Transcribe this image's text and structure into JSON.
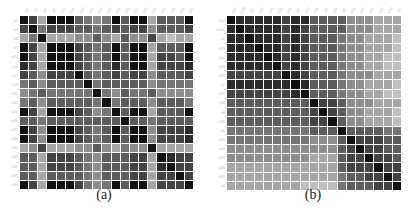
{
  "chart_data": [
    {
      "type": "heatmap",
      "title": "",
      "caption": "(a)",
      "xlabel": "",
      "ylabel": "",
      "colorscale": "grayscale (black = highest similarity, white = lowest)",
      "value_range": [
        0,
        9
      ],
      "value_note": "darkness levels read from pixels: 0 = black, 9 = white",
      "row_labels": [
        "s2",
        "s3",
        "s6",
        "s7",
        "s13",
        "s14",
        "s17",
        "s18",
        "s19",
        "s20",
        "s21",
        "s28",
        "s27",
        "s30",
        "s31",
        "s34",
        "s35",
        "s38",
        "s40"
      ],
      "col_labels": [
        "s2",
        "s3",
        "s6",
        "s7",
        "s13",
        "s14",
        "s17",
        "s18",
        "s19",
        "s20",
        "s21",
        "s28",
        "s27",
        "s30",
        "s31",
        "s34",
        "s35",
        "s38",
        "s40"
      ],
      "matrix": [
        [
          0,
          2,
          6,
          0,
          0,
          0,
          3,
          4,
          5,
          4,
          0,
          3,
          0,
          0,
          6,
          3,
          3,
          3,
          0
        ],
        [
          2,
          0,
          4,
          2,
          2,
          2,
          3,
          3,
          4,
          3,
          2,
          3,
          2,
          2,
          5,
          3,
          3,
          3,
          2
        ],
        [
          6,
          4,
          0,
          6,
          6,
          6,
          5,
          5,
          3,
          5,
          6,
          3,
          5,
          5,
          2,
          6,
          7,
          6,
          6
        ],
        [
          0,
          2,
          6,
          0,
          0,
          0,
          2,
          3,
          4,
          3,
          0,
          3,
          0,
          0,
          6,
          3,
          3,
          3,
          0
        ],
        [
          0,
          2,
          6,
          0,
          0,
          0,
          2,
          3,
          4,
          3,
          0,
          3,
          0,
          0,
          6,
          2,
          2,
          3,
          0
        ],
        [
          1,
          2,
          6,
          0,
          0,
          0,
          2,
          3,
          4,
          3,
          1,
          3,
          0,
          0,
          6,
          2,
          2,
          2,
          1
        ],
        [
          2,
          3,
          5,
          2,
          2,
          2,
          0,
          3,
          4,
          3,
          2,
          3,
          2,
          2,
          5,
          3,
          3,
          3,
          2
        ],
        [
          4,
          3,
          5,
          3,
          3,
          3,
          3,
          0,
          4,
          3,
          3,
          3,
          3,
          3,
          5,
          4,
          4,
          4,
          4
        ],
        [
          5,
          4,
          3,
          4,
          4,
          4,
          4,
          4,
          0,
          4,
          5,
          3,
          4,
          4,
          3,
          5,
          5,
          5,
          5
        ],
        [
          4,
          3,
          5,
          3,
          3,
          3,
          3,
          3,
          4,
          0,
          4,
          3,
          3,
          3,
          5,
          3,
          3,
          3,
          4
        ],
        [
          0,
          2,
          6,
          0,
          0,
          0,
          2,
          3,
          5,
          4,
          0,
          3,
          0,
          0,
          6,
          3,
          3,
          3,
          0
        ],
        [
          3,
          3,
          4,
          3,
          3,
          3,
          3,
          3,
          3,
          3,
          3,
          0,
          3,
          3,
          4,
          3,
          3,
          3,
          3
        ],
        [
          0,
          2,
          5,
          0,
          0,
          0,
          2,
          3,
          4,
          3,
          0,
          3,
          0,
          0,
          5,
          2,
          2,
          2,
          1
        ],
        [
          0,
          2,
          5,
          0,
          0,
          0,
          2,
          3,
          4,
          3,
          0,
          3,
          0,
          0,
          5,
          2,
          2,
          2,
          1
        ],
        [
          6,
          5,
          2,
          6,
          6,
          6,
          5,
          5,
          3,
          5,
          6,
          4,
          5,
          5,
          0,
          6,
          6,
          6,
          6
        ],
        [
          3,
          3,
          6,
          2,
          2,
          2,
          3,
          4,
          5,
          3,
          3,
          3,
          2,
          2,
          6,
          0,
          1,
          2,
          2
        ],
        [
          3,
          3,
          6,
          2,
          2,
          2,
          3,
          4,
          5,
          3,
          3,
          3,
          2,
          2,
          6,
          1,
          0,
          2,
          2
        ],
        [
          3,
          3,
          6,
          3,
          3,
          3,
          3,
          4,
          5,
          3,
          3,
          3,
          2,
          2,
          6,
          2,
          2,
          0,
          2
        ],
        [
          0,
          2,
          6,
          0,
          0,
          0,
          2,
          4,
          5,
          4,
          0,
          3,
          0,
          0,
          6,
          2,
          2,
          2,
          0
        ]
      ]
    },
    {
      "type": "heatmap",
      "title": "",
      "caption": "(b)",
      "xlabel": "",
      "ylabel": "",
      "colorscale": "grayscale (black = highest similarity, white = lowest)",
      "value_range": [
        0,
        9
      ],
      "value_note": "darkness levels read from pixels: 0 = black, 9 = white; reordered/clustered matrix",
      "row_labels": [
        "s10",
        "s100",
        "s2",
        "s19",
        "s44",
        "s35",
        "s16",
        "s7",
        "s27",
        "s36",
        "s8",
        "s38",
        "s6",
        "s13",
        "s40",
        "s23",
        "s29",
        "s30",
        "s4"
      ],
      "col_labels": [
        "s10",
        "s100",
        "s2",
        "s19",
        "s44",
        "s35",
        "s16",
        "s7",
        "s27",
        "s36",
        "s8",
        "s38",
        "s6",
        "s13",
        "s40",
        "s23",
        "s29",
        "s30",
        "s4"
      ],
      "matrix": [
        [
          0,
          1,
          1,
          1,
          1,
          1,
          2,
          1,
          1,
          3,
          3,
          3,
          3,
          5,
          5,
          5,
          6,
          6,
          6
        ],
        [
          1,
          0,
          1,
          1,
          1,
          1,
          2,
          1,
          2,
          3,
          3,
          3,
          3,
          5,
          5,
          5,
          6,
          6,
          6
        ],
        [
          1,
          1,
          0,
          1,
          1,
          1,
          2,
          1,
          2,
          3,
          3,
          3,
          4,
          5,
          5,
          6,
          6,
          6,
          7
        ],
        [
          1,
          1,
          1,
          0,
          1,
          1,
          2,
          1,
          2,
          3,
          3,
          3,
          4,
          5,
          5,
          6,
          6,
          6,
          7
        ],
        [
          1,
          1,
          1,
          1,
          0,
          1,
          2,
          1,
          2,
          3,
          3,
          3,
          4,
          5,
          5,
          6,
          6,
          7,
          7
        ],
        [
          1,
          1,
          1,
          1,
          1,
          0,
          2,
          1,
          2,
          3,
          3,
          3,
          4,
          5,
          5,
          6,
          6,
          7,
          7
        ],
        [
          2,
          2,
          2,
          2,
          2,
          2,
          0,
          1,
          2,
          3,
          3,
          3,
          4,
          5,
          5,
          5,
          6,
          6,
          6
        ],
        [
          1,
          1,
          1,
          1,
          1,
          1,
          1,
          0,
          1,
          3,
          3,
          3,
          4,
          5,
          5,
          6,
          6,
          6,
          7
        ],
        [
          2,
          2,
          2,
          2,
          2,
          2,
          2,
          1,
          0,
          3,
          3,
          3,
          4,
          5,
          5,
          6,
          6,
          7,
          7
        ],
        [
          3,
          3,
          3,
          3,
          3,
          3,
          3,
          3,
          3,
          0,
          2,
          2,
          3,
          5,
          5,
          5,
          6,
          6,
          6
        ],
        [
          3,
          3,
          3,
          3,
          3,
          3,
          3,
          3,
          3,
          2,
          0,
          2,
          3,
          5,
          5,
          6,
          6,
          6,
          7
        ],
        [
          3,
          3,
          3,
          3,
          3,
          3,
          3,
          3,
          3,
          2,
          2,
          0,
          3,
          5,
          5,
          6,
          6,
          6,
          7
        ],
        [
          4,
          4,
          4,
          4,
          4,
          4,
          4,
          4,
          4,
          3,
          3,
          3,
          0,
          3,
          3,
          3,
          3,
          4,
          4
        ],
        [
          4,
          4,
          4,
          4,
          4,
          4,
          4,
          4,
          4,
          5,
          5,
          5,
          3,
          0,
          2,
          2,
          2,
          3,
          3
        ],
        [
          5,
          5,
          5,
          5,
          5,
          5,
          5,
          5,
          5,
          5,
          5,
          5,
          3,
          2,
          0,
          2,
          2,
          3,
          3
        ],
        [
          5,
          5,
          5,
          5,
          5,
          5,
          5,
          5,
          5,
          6,
          6,
          6,
          3,
          2,
          2,
          0,
          2,
          2,
          3
        ],
        [
          6,
          6,
          6,
          6,
          6,
          6,
          6,
          6,
          6,
          6,
          6,
          6,
          3,
          2,
          2,
          2,
          0,
          2,
          2
        ],
        [
          6,
          6,
          6,
          6,
          6,
          6,
          6,
          6,
          6,
          6,
          6,
          6,
          4,
          3,
          3,
          2,
          2,
          0,
          2
        ],
        [
          6,
          6,
          6,
          6,
          6,
          6,
          6,
          6,
          7,
          7,
          7,
          7,
          4,
          3,
          3,
          3,
          2,
          2,
          0
        ]
      ]
    }
  ],
  "figure": {
    "panels": [
      {
        "caption": "(a)"
      },
      {
        "caption": "(b)"
      }
    ]
  }
}
